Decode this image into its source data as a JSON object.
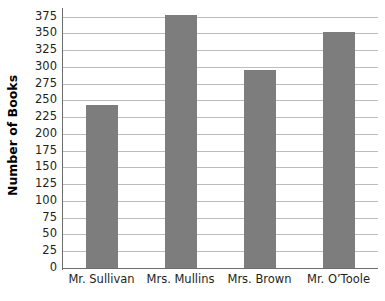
{
  "chart_data": {
    "type": "bar",
    "title": "",
    "xlabel": "",
    "ylabel": "Number of Books",
    "categories": [
      "Mr. Sullivan",
      "Mrs. Mullins",
      "Mrs. Brown",
      "Mr. O’Toole"
    ],
    "values": [
      243,
      377,
      296,
      352
    ],
    "ylim": [
      0,
      385
    ],
    "ytick_labels": [
      "0",
      "25",
      "50",
      "75",
      "100",
      "125",
      "150",
      "175",
      "200",
      "225",
      "250",
      "275",
      "300",
      "325",
      "350",
      "375"
    ],
    "ytick_values": [
      0,
      25,
      50,
      75,
      100,
      125,
      150,
      175,
      200,
      225,
      250,
      275,
      300,
      325,
      350,
      375
    ],
    "grid": true,
    "legend": "none",
    "bar_color": "#7d7d7d",
    "gridline_color": "#bcbcbc",
    "axis_color": "#6d6d6d",
    "background_color": "#ffffff"
  }
}
